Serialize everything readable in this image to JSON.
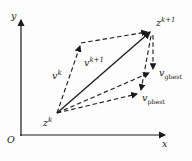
{
  "labels": {
    "y_axis": "y",
    "x_axis": "x",
    "origin": "O",
    "z_k": {
      "base": "z",
      "sup": "k"
    },
    "z_k1": {
      "base": "z",
      "sup": "k+1"
    },
    "v_k": {
      "base": "v",
      "sup": "k"
    },
    "v_k1": {
      "base": "v",
      "sup": "k+1"
    },
    "v_gbest": {
      "base": "v",
      "sub": "gbest"
    },
    "v_pbest": {
      "base": "v",
      "sub": "pbest"
    }
  },
  "colors": {
    "ink": "#1a1a1a",
    "background": "#fdfdfd"
  }
}
